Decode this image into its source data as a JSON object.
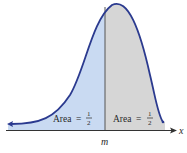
{
  "figure": {
    "axis_label": "x",
    "median_label": "m",
    "left_region": {
      "label": "Area",
      "equals": "=",
      "numerator": "1",
      "denominator": "2",
      "fill": "#c9daf2"
    },
    "right_region": {
      "label": "Area",
      "equals": "=",
      "numerator": "1",
      "denominator": "2",
      "fill": "#d6d6d6"
    },
    "curve_color": "#2b3a8f",
    "median_line_color": "#555555",
    "axis_color": "#333333"
  }
}
